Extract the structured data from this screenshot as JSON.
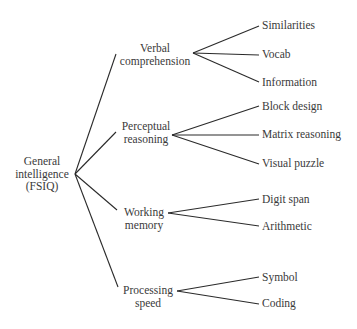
{
  "diagram": {
    "root": {
      "line1": "General",
      "line2": "intelligence",
      "line3": "(FSIQ)"
    },
    "factors": [
      {
        "line1": "Verbal",
        "line2": "comprehension",
        "subtests": [
          "Similarities",
          "Vocab",
          "Information"
        ]
      },
      {
        "line1": "Perceptual",
        "line2": "reasoning",
        "subtests": [
          "Block design",
          "Matrix reasoning",
          "Visual puzzle"
        ]
      },
      {
        "line1": "Working",
        "line2": "memory",
        "subtests": [
          "Digit span",
          "Arithmetic"
        ]
      },
      {
        "line1": "Processing",
        "line2": "speed",
        "subtests": [
          "Symbol",
          "Coding"
        ]
      }
    ]
  }
}
